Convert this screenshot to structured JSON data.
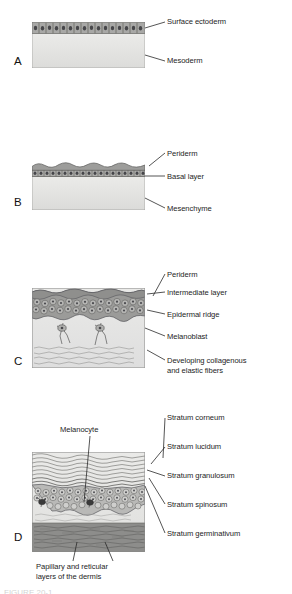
{
  "figure": {
    "panels": [
      {
        "id": "A",
        "letter": "A",
        "labels": [
          {
            "name": "surface-ectoderm",
            "text": "Surface ectoderm"
          },
          {
            "name": "mesoderm",
            "text": "Mesoderm"
          }
        ]
      },
      {
        "id": "B",
        "letter": "B",
        "labels": [
          {
            "name": "periderm",
            "text": "Periderm"
          },
          {
            "name": "basal-layer",
            "text": "Basal layer"
          },
          {
            "name": "mesenchyme",
            "text": "Mesenchyme"
          }
        ]
      },
      {
        "id": "C",
        "letter": "C",
        "labels": [
          {
            "name": "periderm",
            "text": "Periderm"
          },
          {
            "name": "intermediate-layer",
            "text": "Intermediate layer"
          },
          {
            "name": "epidermal-ridge",
            "text": "Epidermal ridge"
          },
          {
            "name": "melanoblast",
            "text": "Melanoblast"
          },
          {
            "name": "developing-fibers-line1",
            "text": "Developing collagenous"
          },
          {
            "name": "developing-fibers-line2",
            "text": "and elastic fibers"
          }
        ]
      },
      {
        "id": "D",
        "letter": "D",
        "labels": [
          {
            "name": "melanocyte",
            "text": "Melanocyte"
          },
          {
            "name": "stratum-corneum",
            "text": "Stratum corneum"
          },
          {
            "name": "stratum-lucidum",
            "text": "Stratum lucidum"
          },
          {
            "name": "stratum-granulosum",
            "text": "Stratum granulosum"
          },
          {
            "name": "stratum-spinosum",
            "text": "Stratum spinosum"
          },
          {
            "name": "stratum-germinativum",
            "text": "Stratum germinativum"
          },
          {
            "name": "dermis-layers-line1",
            "text": "Papillary and reticular"
          },
          {
            "name": "dermis-layers-line2",
            "text": "layers of the dermis"
          }
        ]
      }
    ],
    "colors": {
      "cell_fill": "#a9a9a7",
      "cell_stroke": "#5a5a58",
      "mesoderm_fill": "#e5e5e3",
      "dermis_dark": "#8b8b89",
      "leader_line": "#2a2a2a",
      "text": "#1d1d1d"
    }
  }
}
